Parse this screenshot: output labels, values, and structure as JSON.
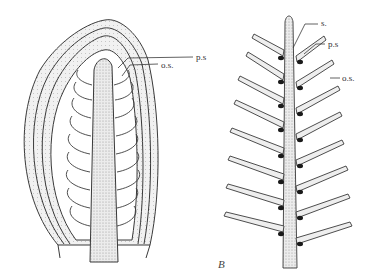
{
  "figure": {
    "panel_a": {
      "description": "Longitudinal section of cone / bract-scale complex",
      "labels": {
        "ps": "p.s",
        "os": "o.s."
      }
    },
    "panel_b": {
      "panel_label": "B",
      "description": "Branched axis with paired scales",
      "labels": {
        "s": "s.",
        "ps": "p.s",
        "os": "o.s."
      }
    },
    "colors": {
      "ink": "#3a3a3a",
      "stipple": "#e2e2e2",
      "background": "#ffffff"
    }
  }
}
